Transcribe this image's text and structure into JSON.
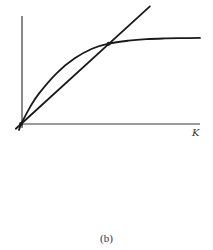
{
  "chart_data": {
    "type": "line",
    "title": "",
    "xlabel": "K",
    "ylabel": "",
    "caption": "(b)",
    "grid": false,
    "legend": "none",
    "xlim": [
      0,
      1
    ],
    "ylim": [
      0,
      1
    ],
    "series": [
      {
        "name": "concave-saturating-curve",
        "description": "increasing concave curve starting at origin, saturating toward an upper asymptote",
        "x": [
          0,
          0.05,
          0.1,
          0.2,
          0.3,
          0.4,
          0.49,
          0.6,
          0.7,
          0.8,
          0.9,
          1.0
        ],
        "y": [
          0,
          0.17,
          0.31,
          0.52,
          0.67,
          0.77,
          0.82,
          0.85,
          0.866,
          0.873,
          0.876,
          0.878
        ]
      },
      {
        "name": "straight-line-through-origin",
        "description": "straight line from origin with constant slope",
        "x": [
          0,
          0.49,
          0.72
        ],
        "y": [
          0,
          0.82,
          1.2
        ]
      }
    ],
    "annotations": [
      {
        "type": "point",
        "label": "intersection",
        "x": 0.49,
        "y": 0.82
      },
      {
        "type": "point",
        "label": "origin",
        "x": 0,
        "y": 0
      }
    ]
  },
  "caption": "(b)"
}
